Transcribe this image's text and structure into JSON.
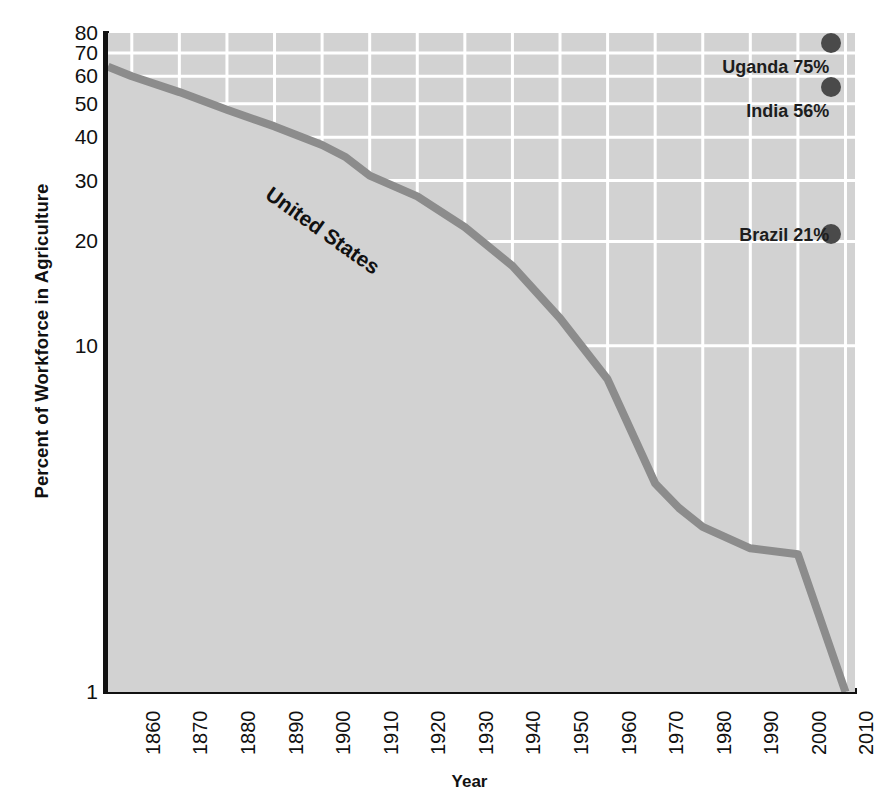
{
  "chart_data": {
    "type": "line",
    "title": "",
    "xlabel": "Year",
    "ylabel": "Percent of Workforce in Agriculture",
    "xlim": [
      1855,
      2012
    ],
    "ylim": [
      1,
      80
    ],
    "yscale": "log",
    "grid": true,
    "legend_position": "none",
    "xticks": [
      "1860",
      "1870",
      "1880",
      "1890",
      "1900",
      "1910",
      "1920",
      "1930",
      "1940",
      "1950",
      "1960",
      "1970",
      "1980",
      "1990",
      "2000",
      "2010"
    ],
    "yticks": [
      "1",
      "10",
      "20",
      "30",
      "40",
      "50",
      "60",
      "70",
      "80"
    ],
    "ytick_values": [
      1,
      10,
      20,
      30,
      40,
      50,
      60,
      70,
      80
    ],
    "series": [
      {
        "name": "United States",
        "label": "United States",
        "color": "#8c8c8c",
        "fill": true,
        "x": [
          1855,
          1860,
          1870,
          1880,
          1890,
          1900,
          1905,
          1910,
          1920,
          1930,
          1940,
          1950,
          1960,
          1970,
          1975,
          1980,
          1990,
          2000,
          2010
        ],
        "values": [
          64,
          60,
          54,
          48,
          43,
          38,
          35,
          31,
          27,
          22,
          17,
          12,
          8,
          4,
          3.4,
          3,
          2.6,
          2.5,
          1
        ]
      }
    ],
    "annotations": [
      {
        "label": "Uganda 75%",
        "country": "Uganda",
        "value": 75,
        "x": 2007,
        "marker": "dot",
        "color": "#4a4a4a"
      },
      {
        "label": "India 56%",
        "country": "India",
        "value": 56,
        "x": 2007,
        "marker": "dot",
        "color": "#4a4a4a"
      },
      {
        "label": "Brazil 21%",
        "country": "Brazil",
        "value": 21,
        "x": 2007,
        "marker": "dot",
        "color": "#4a4a4a"
      }
    ],
    "plot_background": "#d2d2d2",
    "gridline_color": "#ffffff",
    "axis_color": "#111111"
  }
}
